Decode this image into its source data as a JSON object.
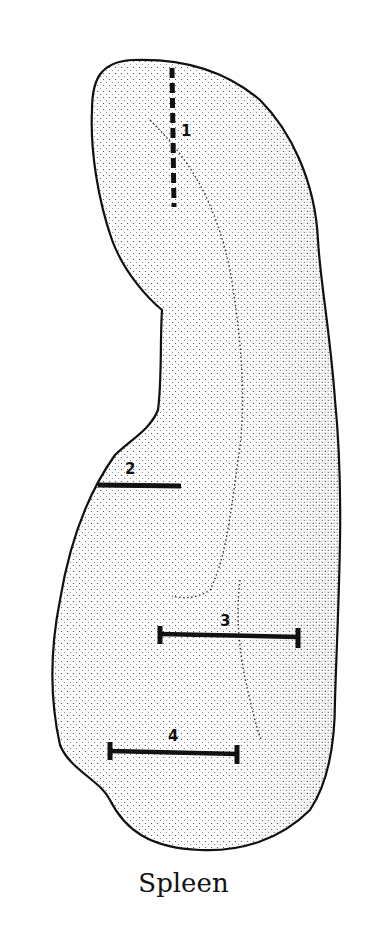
{
  "figure": {
    "caption": "Spleen",
    "outline_color": "#111111",
    "background": "#ffffff",
    "measurements": [
      {
        "id": "1",
        "label": "1",
        "style": "dashed-vertical"
      },
      {
        "id": "2",
        "label": "2",
        "style": "solid-horizontal"
      },
      {
        "id": "3",
        "label": "3",
        "style": "caliper-horizontal"
      },
      {
        "id": "4",
        "label": "4",
        "style": "caliper-horizontal"
      }
    ]
  }
}
